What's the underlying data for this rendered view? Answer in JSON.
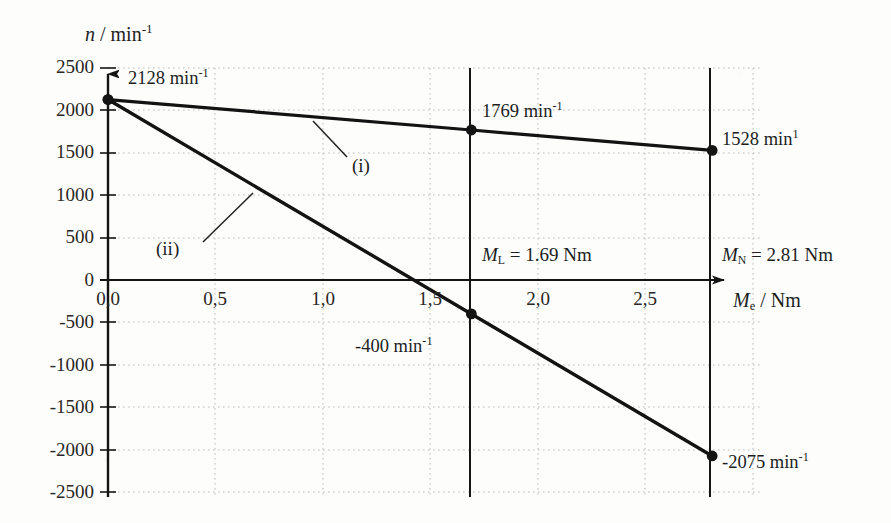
{
  "chart_data": {
    "type": "line",
    "title": "",
    "xlabel": "M_e / Nm",
    "ylabel": "n / min-1",
    "xlabel_parts": {
      "sym": "M",
      "sub": "e",
      "rest": " / Nm"
    },
    "ylabel_parts": {
      "sym": "n",
      "rest": " / min",
      "sup": "-1"
    },
    "xlim": [
      0.0,
      3.0
    ],
    "ylim": [
      -2500,
      2500
    ],
    "xticks": [
      0.0,
      0.5,
      1.0,
      1.5,
      2.0,
      2.5
    ],
    "xticklabels": [
      "0,0",
      "0,5",
      "1,0",
      "1,5",
      "2,0",
      "2,5"
    ],
    "yticks": [
      2500,
      2000,
      1500,
      1000,
      500,
      0,
      -500,
      -1000,
      -1500,
      -2000,
      -2500
    ],
    "yticklabels": [
      "2500",
      "2000",
      "1500",
      "1000",
      "500",
      "0",
      "-500",
      "-1000",
      "-1500",
      "-2000",
      "-2500"
    ],
    "grid": true,
    "grid_style": "dotted",
    "legend": "inline-labels",
    "series": [
      {
        "name": "(i)",
        "label": "(i)",
        "x": [
          0.0,
          1.69,
          2.81
        ],
        "values": [
          2128,
          1769,
          1528
        ],
        "markers": [
          true,
          true,
          true
        ]
      },
      {
        "name": "(ii)",
        "label": "(ii)",
        "x": [
          0.0,
          1.69,
          2.81
        ],
        "values": [
          2128,
          -400,
          -2075
        ],
        "markers": [
          true,
          true,
          true
        ]
      }
    ],
    "point_annotations": [
      {
        "text": "2128 min",
        "sup": "-1",
        "x": 0.0,
        "y": 2128
      },
      {
        "text": "1769 min",
        "sup": "-1",
        "x": 1.69,
        "y": 1769
      },
      {
        "text": "1528 min",
        "sup": "1",
        "x": 2.81,
        "y": 1528
      },
      {
        "text": "-400 min",
        "sup": "-1",
        "x": 1.69,
        "y": -400
      },
      {
        "text": "-2075 min",
        "sup": "-1",
        "x": 2.81,
        "y": -2075
      }
    ],
    "vertical_markers": [
      {
        "name": "M_L",
        "sym": "M",
        "sub": "L",
        "rest": " = 1.69 Nm",
        "value": 1.69
      },
      {
        "name": "M_N",
        "sym": "M",
        "sub": "N",
        "rest": " = 2.81 Nm",
        "value": 2.81
      }
    ],
    "colors": {
      "curve": "#141414",
      "axis": "#141414",
      "grid": "#b9b9b9",
      "background": "#fdfdfc",
      "text": "#201e1c"
    }
  },
  "annotations": {
    "p2128": "2128 min",
    "p2128_sup": "-1",
    "p1769": "1769 min",
    "p1769_sup": "-1",
    "p1528": "1528 min",
    "p1528_sup": "1",
    "p400": "-400 min",
    "p400_sup": "-1",
    "p2075": "-2075 min",
    "p2075_sup": "-1",
    "curve_i": "(i)",
    "curve_ii": "(ii)",
    "ml_sym": "M",
    "ml_sub": "L",
    "ml_rest": " = 1.69 Nm",
    "mn_sym": "M",
    "mn_sub": "N",
    "mn_rest": " = 2.81 Nm"
  },
  "axes": {
    "y_title_sym": "n",
    "y_title_rest": " / min",
    "y_title_sup": "-1",
    "x_title_sym": "M",
    "x_title_sub": "e",
    "x_title_rest": " / Nm",
    "yticklabels": [
      "2500",
      "2000",
      "1500",
      "1000",
      "500",
      "0",
      "-500",
      "-1000",
      "-1500",
      "-2000",
      "-2500"
    ],
    "xticklabels": [
      "0,0",
      "0,5",
      "1,0",
      "1,5",
      "2,0",
      "2,5"
    ]
  }
}
